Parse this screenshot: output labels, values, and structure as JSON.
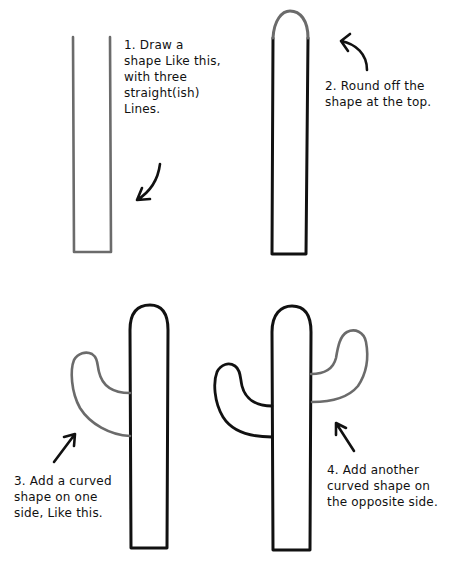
{
  "colors": {
    "background": "#ffffff",
    "ink": "#111111",
    "new_stroke": "#6b6b6b"
  },
  "steps": [
    {
      "number": "1",
      "text": "1. Draw a\nshape Like this,\nwith three\nstraight(ish)\nLines."
    },
    {
      "number": "2",
      "text": "2. Round off the\nshape at the top."
    },
    {
      "number": "3",
      "text": "3. Add a curved\nshape on one\nside, Like this."
    },
    {
      "number": "4",
      "text": "4. Add another\ncurved shape on\nthe opposite side."
    }
  ]
}
